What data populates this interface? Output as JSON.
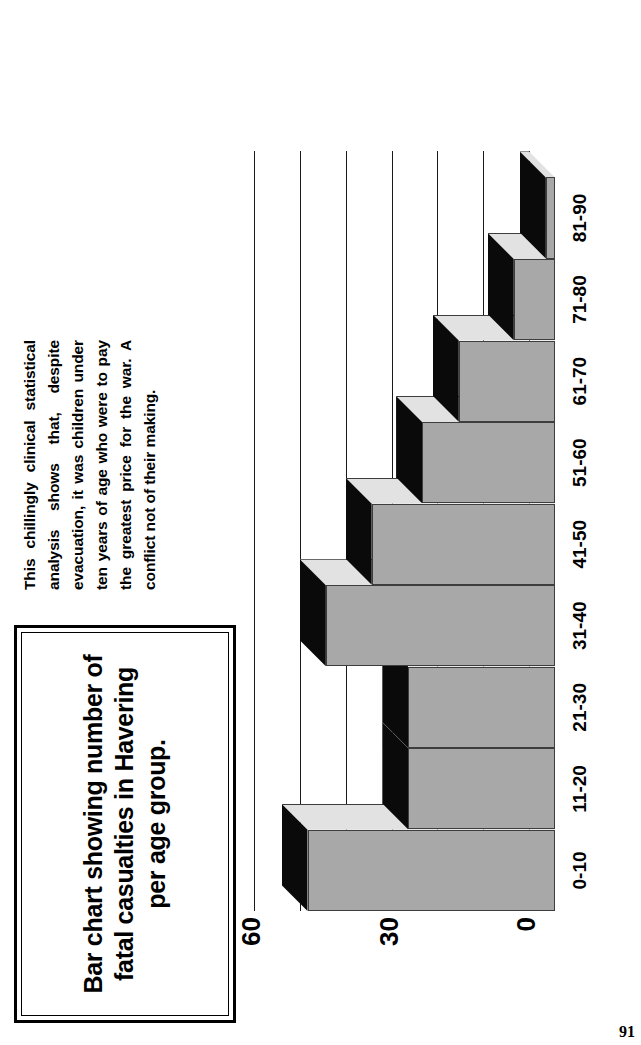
{
  "page": {
    "number": "91"
  },
  "title_box": {
    "title": "Bar chart showing number of fatal casualties in Havering per age group."
  },
  "caption": {
    "text": "This chillingly clinical statistical analysis shows that, despite evacuation, it was children under ten years of age who were to pay the greatest price for the war. A conflict not of their making."
  },
  "chart_data": {
    "type": "bar",
    "orientation": "vertical",
    "title": "Bar chart showing number of fatal casualties in Havering per age group.",
    "xlabel": "",
    "ylabel": "",
    "categories": [
      "0-10",
      "11-20",
      "21-30",
      "31-40",
      "41-50",
      "51-60",
      "61-70",
      "71-80",
      "81-90"
    ],
    "values": [
      54,
      32,
      32,
      50,
      40,
      29,
      21,
      9,
      2
    ],
    "ylim": [
      0,
      60
    ],
    "yticks": [
      0,
      10,
      20,
      30,
      40,
      50,
      60
    ],
    "ytick_labels_shown": [
      "0",
      "30",
      "60"
    ],
    "grid": true,
    "legend": "none",
    "style": "3d-bar",
    "colors": {
      "bar_front": "#a8a8a8",
      "bar_top": "#0a0a0a",
      "bar_side": "#e2e2e2",
      "outline": "#3d3d3d",
      "background": "#ffffff",
      "text": "#000000"
    }
  }
}
